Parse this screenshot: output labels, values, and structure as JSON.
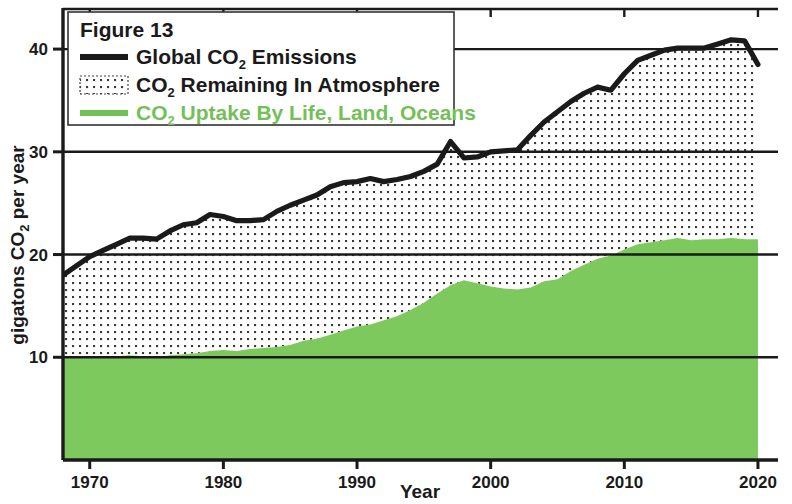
{
  "figure": {
    "legend_title": "Figure 13",
    "box_border_color": "#333333"
  },
  "legend": {
    "items": [
      {
        "label_parts": [
          "Global CO",
          "2",
          " Emissions"
        ],
        "label": "Global CO2 Emissions",
        "swatch": "solid-black-line",
        "color": "#1a1a1a",
        "name": "emissions"
      },
      {
        "label_parts": [
          "CO",
          "2",
          " Remaining In Atmosphere"
        ],
        "label": "CO2 Remaining In Atmosphere",
        "swatch": "dotted-fill-box",
        "color": "#1a1a1a",
        "name": "remaining"
      },
      {
        "label_parts": [
          "CO",
          "2",
          " Uptake By Life, Land, Oceans"
        ],
        "label": "CO2 Uptake By Life, Land, Oceans",
        "swatch": "solid-green-line",
        "color": "#74bf5a",
        "name": "uptake"
      }
    ]
  },
  "axes": {
    "x_title": "Year",
    "y_title_parts": [
      "gigatons CO",
      "2",
      " per year"
    ],
    "y_title": "gigatons CO2 per year",
    "x_ticks": [
      "1970",
      "1980",
      "1990",
      "2000",
      "2010",
      "2020"
    ],
    "y_ticks": [
      "10",
      "20",
      "30",
      "40"
    ]
  },
  "chart_data": {
    "type": "area",
    "title": "Figure 13",
    "xlabel": "Year",
    "ylabel": "gigatons CO2 per year",
    "xlim": [
      1968,
      2021.5
    ],
    "ylim": [
      0,
      44
    ],
    "xticks": [
      1970,
      1980,
      1990,
      2000,
      2010,
      2020
    ],
    "yticks": [
      10,
      20,
      30,
      40
    ],
    "grid": true,
    "legend_position": "top-left",
    "colors": {
      "emissions": "#1a1a1a",
      "uptake": "#7dc95e",
      "uptake_line": "#74bf5a"
    },
    "x": [
      1968,
      1969,
      1970,
      1971,
      1972,
      1973,
      1974,
      1975,
      1976,
      1977,
      1978,
      1979,
      1980,
      1981,
      1982,
      1983,
      1984,
      1985,
      1986,
      1987,
      1988,
      1989,
      1990,
      1991,
      1992,
      1993,
      1994,
      1995,
      1996,
      1997,
      1998,
      1999,
      2000,
      2001,
      2002,
      2003,
      2004,
      2005,
      2006,
      2007,
      2008,
      2009,
      2010,
      2011,
      2012,
      2013,
      2014,
      2015,
      2016,
      2017,
      2018,
      2019,
      2020
    ],
    "series": [
      {
        "name": "Global CO2 Emissions",
        "type": "line",
        "values": [
          18.0,
          18.9,
          19.8,
          20.4,
          21.0,
          21.6,
          21.6,
          21.5,
          22.3,
          22.9,
          23.1,
          23.9,
          23.7,
          23.3,
          23.3,
          23.4,
          24.2,
          24.8,
          25.3,
          25.8,
          26.6,
          27.0,
          27.1,
          27.4,
          27.1,
          27.3,
          27.6,
          28.1,
          28.8,
          31.0,
          29.4,
          29.5,
          30.0,
          30.1,
          30.2,
          31.6,
          32.9,
          33.9,
          34.9,
          35.7,
          36.3,
          36.0,
          37.6,
          38.9,
          39.4,
          39.9,
          40.1,
          40.1,
          40.1,
          40.5,
          40.9,
          40.8,
          38.5
        ],
        "color": "#1a1a1a"
      },
      {
        "name": "CO2 Uptake By Life, Land, Oceans",
        "type": "area",
        "values": [
          10.0,
          10.1,
          10.0,
          10.0,
          10.1,
          10.2,
          10.1,
          10.0,
          10.2,
          10.3,
          10.4,
          10.6,
          10.7,
          10.6,
          10.8,
          10.9,
          11.0,
          11.2,
          11.6,
          11.8,
          12.2,
          12.6,
          13.0,
          13.2,
          13.6,
          14.0,
          14.6,
          15.3,
          16.2,
          17.0,
          17.5,
          17.2,
          16.9,
          16.7,
          16.6,
          16.8,
          17.4,
          17.6,
          18.4,
          19.0,
          19.6,
          19.9,
          20.5,
          21.0,
          21.2,
          21.4,
          21.6,
          21.4,
          21.5,
          21.5,
          21.6,
          21.5,
          21.5
        ],
        "color": "#7dc95e"
      },
      {
        "name": "CO2 Remaining In Atmosphere",
        "type": "band-between",
        "note": "dotted region between uptake area top and emissions line",
        "fill": "dot-pattern"
      }
    ]
  }
}
